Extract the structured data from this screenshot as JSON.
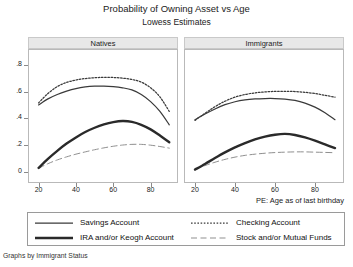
{
  "header": {
    "title": "Probability of Owning Asset vs Age",
    "subtitle": "Lowess Estimates"
  },
  "footer": {
    "caption": "Graphs by Immigrant Status"
  },
  "axis": {
    "xlabel": "PE: Age as of last birthday",
    "yticks": [
      "0",
      ".2",
      ".4",
      ".6",
      ".8"
    ],
    "ytick_values": [
      0,
      0.2,
      0.4,
      0.6,
      0.8
    ],
    "xticks": [
      "20",
      "40",
      "60",
      "80"
    ],
    "xtick_values": [
      20,
      40,
      60,
      80
    ]
  },
  "legend": {
    "items": [
      {
        "label": "Savings Account",
        "style": "solid-thin",
        "color": "#3a3a3a"
      },
      {
        "label": "Checking Account",
        "style": "dotted",
        "color": "#3a3a3a"
      },
      {
        "label": "IRA and/or Keogh Account",
        "style": "solid-thick",
        "color": "#2a2a2a"
      },
      {
        "label": "Stock and/or Mutual Funds",
        "style": "dashed",
        "color": "#8a8a8a"
      }
    ]
  },
  "chart_data": {
    "type": "line",
    "title": "Probability of Owning Asset vs Age",
    "subtitle": "Lowess Estimates",
    "xlabel": "PE: Age as of last birthday",
    "ylabel": "",
    "xlim": [
      17,
      92
    ],
    "ylim": [
      0,
      0.88
    ],
    "grid": false,
    "legend_position": "bottom",
    "panel_label": "Graphs by Immigrant Status",
    "panels": [
      {
        "name": "Natives",
        "x": [
          20,
          25,
          30,
          35,
          40,
          45,
          50,
          55,
          60,
          65,
          70,
          75,
          80,
          85,
          90
        ],
        "series": [
          {
            "name": "Savings Account",
            "style": "solid-thin",
            "values": [
              0.5,
              0.545,
              0.578,
              0.603,
              0.622,
              0.634,
              0.64,
              0.641,
              0.637,
              0.628,
              0.612,
              0.578,
              0.525,
              0.452,
              0.352
            ]
          },
          {
            "name": "Checking Account",
            "style": "dotted",
            "values": [
              0.515,
              0.585,
              0.637,
              0.668,
              0.686,
              0.697,
              0.703,
              0.706,
              0.705,
              0.7,
              0.69,
              0.67,
              0.628,
              0.56,
              0.452
            ]
          },
          {
            "name": "IRA and/or Keogh Account",
            "style": "solid-thick",
            "values": [
              0.03,
              0.098,
              0.158,
              0.212,
              0.258,
              0.298,
              0.33,
              0.355,
              0.372,
              0.38,
              0.374,
              0.352,
              0.318,
              0.272,
              0.222
            ]
          },
          {
            "name": "Stock and/or Mutual Funds",
            "style": "dashed",
            "values": [
              0.028,
              0.062,
              0.09,
              0.113,
              0.133,
              0.15,
              0.166,
              0.18,
              0.192,
              0.201,
              0.206,
              0.206,
              0.2,
              0.19,
              0.178
            ]
          }
        ]
      },
      {
        "name": "Immigrants",
        "x": [
          20,
          25,
          30,
          35,
          40,
          45,
          50,
          55,
          60,
          65,
          70,
          75,
          80,
          85,
          90
        ],
        "series": [
          {
            "name": "Savings Account",
            "style": "solid-thin",
            "values": [
              0.39,
              0.432,
              0.47,
              0.502,
              0.524,
              0.538,
              0.545,
              0.548,
              0.548,
              0.544,
              0.534,
              0.514,
              0.484,
              0.442,
              0.39
            ]
          },
          {
            "name": "Checking Account",
            "style": "dotted",
            "values": [
              0.385,
              0.438,
              0.487,
              0.528,
              0.558,
              0.578,
              0.59,
              0.597,
              0.601,
              0.602,
              0.6,
              0.594,
              0.585,
              0.572,
              0.558
            ]
          },
          {
            "name": "IRA and/or Keogh Account",
            "style": "solid-thick",
            "values": [
              0.018,
              0.06,
              0.104,
              0.146,
              0.184,
              0.216,
              0.243,
              0.264,
              0.278,
              0.284,
              0.276,
              0.258,
              0.234,
              0.206,
              0.178
            ]
          },
          {
            "name": "Stock and/or Mutual Funds",
            "style": "dashed",
            "values": [
              0.02,
              0.048,
              0.073,
              0.094,
              0.111,
              0.124,
              0.133,
              0.14,
              0.145,
              0.148,
              0.15,
              0.15,
              0.148,
              0.146,
              0.144
            ]
          }
        ]
      }
    ]
  }
}
